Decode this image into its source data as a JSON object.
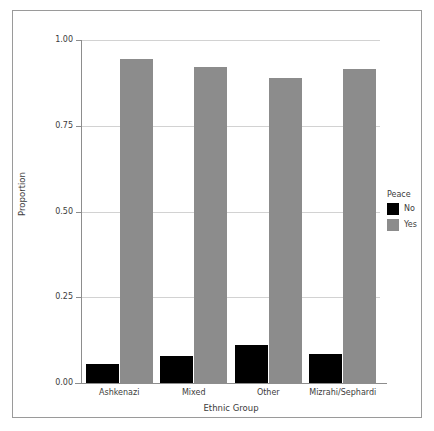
{
  "chart_data": {
    "type": "bar",
    "title": "",
    "xlabel": "Ethnic Group",
    "ylabel": "Proportion",
    "categories": [
      "Ashkenazi",
      "Mixed",
      "Other",
      "Mizrahi/Sephardi"
    ],
    "series": [
      {
        "name": "No",
        "color": "#000000",
        "values": [
          0.055,
          0.08,
          0.11,
          0.085
        ]
      },
      {
        "name": "Yes",
        "color": "#8c8c8c",
        "values": [
          0.945,
          0.92,
          0.89,
          0.915
        ]
      }
    ],
    "legend": {
      "title": "Peace",
      "position": "right",
      "entries": [
        "No",
        "Yes"
      ]
    },
    "ylim": [
      0.0,
      1.0
    ],
    "ytick_labels": [
      "0.00",
      "0.25",
      "0.50",
      "0.75",
      "1.00"
    ],
    "ytick_values": [
      0.0,
      0.25,
      0.5,
      0.75,
      1.0
    ],
    "grid": true,
    "grid_color": "#d2d2d2",
    "axis_color": "#8d8d8d",
    "frame_color": "#9a9a9a",
    "background": "#ffffff"
  }
}
